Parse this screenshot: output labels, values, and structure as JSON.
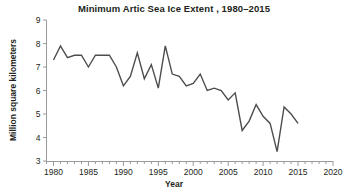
{
  "chart_data": {
    "type": "line",
    "title": "Minimum Artic Sea Ice Extent , 1980–2015",
    "xlabel": "Year",
    "ylabel": "Million square kilometers",
    "xlim": [
      1979,
      2020
    ],
    "ylim": [
      3,
      9
    ],
    "xticks": [
      1980,
      1985,
      1990,
      1995,
      2000,
      2005,
      2010,
      2015,
      2020
    ],
    "xtick_labels": [
      "1980",
      "1985",
      "1990",
      "1995",
      "2000",
      "2005",
      "2010",
      "2015",
      "2020"
    ],
    "x_minor_tick_step": 1,
    "yticks": [
      3,
      4,
      5,
      6,
      7,
      8,
      9
    ],
    "ytick_labels": [
      "3",
      "4",
      "5",
      "6",
      "7",
      "8",
      "9"
    ],
    "grid": false,
    "legend": "none",
    "line_color": "#4d4d4d",
    "line_width": 1.4,
    "x": [
      1980,
      1981,
      1982,
      1983,
      1984,
      1985,
      1986,
      1987,
      1988,
      1989,
      1990,
      1991,
      1992,
      1993,
      1994,
      1995,
      1996,
      1997,
      1998,
      1999,
      2000,
      2001,
      2002,
      2003,
      2004,
      2005,
      2006,
      2007,
      2008,
      2009,
      2010,
      2011,
      2012,
      2013,
      2014,
      2015
    ],
    "values": [
      7.3,
      7.9,
      7.4,
      7.5,
      7.5,
      7.0,
      7.5,
      7.5,
      7.5,
      7.0,
      6.2,
      6.6,
      7.6,
      6.5,
      7.1,
      6.1,
      7.9,
      6.7,
      6.6,
      6.2,
      6.3,
      6.7,
      6.0,
      6.1,
      6.0,
      5.6,
      5.9,
      4.3,
      4.7,
      5.4,
      4.9,
      4.6,
      3.4,
      5.3,
      5.0,
      4.6
    ],
    "series_name": "Minimum Arctic sea ice extent"
  }
}
